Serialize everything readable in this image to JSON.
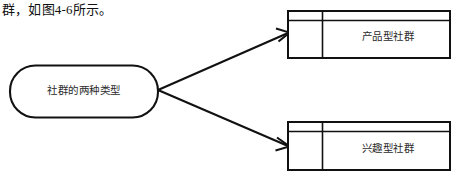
{
  "page": {
    "caption": "群，如图4-6所示。"
  },
  "diagram": {
    "type": "flow-diagram",
    "stroke_color": "#111111",
    "fill_color": "#ffffff",
    "source_node": {
      "shape": "rounded-rectangle",
      "label": "社群的两种类型"
    },
    "target_nodes": [
      {
        "shape": "3d-box",
        "label": "产品型社群",
        "position": "top-right"
      },
      {
        "shape": "3d-box",
        "label": "兴趣型社群",
        "position": "bottom-right"
      }
    ],
    "connectors": [
      {
        "from": "社群的两种类型",
        "to": "产品型社群",
        "style": "arrow",
        "direction": "up-right"
      },
      {
        "from": "社群的两种类型",
        "to": "兴趣型社群",
        "style": "arrow",
        "direction": "down-right"
      }
    ]
  }
}
